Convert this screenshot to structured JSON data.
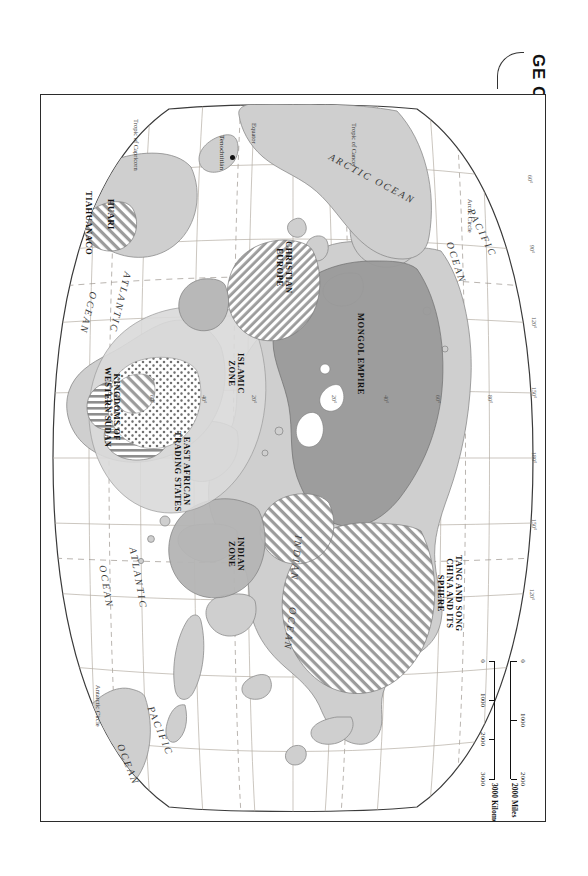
{
  "figure": {
    "title": "GE OF EXPANDING ZONES OF CULTURE, 500–1500",
    "title_note_truncated": true
  },
  "scale": {
    "miles_unit": "2000 Miles",
    "km_unit": "3000 Kilometers",
    "miles_ticks": [
      "0",
      "1000",
      "2000"
    ],
    "km_ticks": [
      "0",
      "1000",
      "2000",
      "3000"
    ]
  },
  "oceans": [
    {
      "name": "ARCTIC OCEAN",
      "id": "arctic-ocean"
    },
    {
      "name": "PACIFIC",
      "id": "pacific-1"
    },
    {
      "name": "OCEAN",
      "id": "pacific-1-ocean"
    },
    {
      "name": "INDIAN",
      "id": "indian-ocean"
    },
    {
      "name": "OCEAN",
      "id": "indian-ocean-word"
    },
    {
      "name": "ATLANTIC",
      "id": "atlantic-n"
    },
    {
      "name": "OCEAN",
      "id": "atlantic-n-ocean"
    },
    {
      "name": "ATLANTIC",
      "id": "atlantic-s"
    },
    {
      "name": "OCEAN",
      "id": "atlantic-s-ocean"
    },
    {
      "name": "PACIFIC",
      "id": "pacific-2"
    },
    {
      "name": "OCEAN",
      "id": "pacific-2-ocean"
    }
  ],
  "zones": [
    {
      "id": "mongol-empire",
      "label": "MONGOL EMPIRE",
      "pattern": "solid-dark-gray"
    },
    {
      "id": "tang-song-china",
      "label": "TANG AND SONG\nCHINA AND ITS\nSPHERE",
      "pattern": "diagonal-hatch"
    },
    {
      "id": "indian-zone",
      "label": "INDIAN\nZONE",
      "pattern": "solid-mid-gray"
    },
    {
      "id": "islamic-zone",
      "label": "ISLAMIC\nZONE",
      "pattern": "solid-light-gray"
    },
    {
      "id": "christian-europe",
      "label": "CHRISTIAN\nEUROPE",
      "pattern": "diagonal-hatch"
    },
    {
      "id": "east-african-trading-states",
      "label": "EAST AFRICAN\nTRADING STATES",
      "pattern": "vertical-hatch"
    },
    {
      "id": "kingdoms-western-sudan",
      "label": "KINGDOMS OF\nWESTERN SUDAN",
      "pattern": "stipple-dots"
    },
    {
      "id": "huari",
      "label": "HUARI",
      "pattern": "diagonal-hatch"
    },
    {
      "id": "tiahuanaco",
      "label": "TIAHUANACO",
      "pattern": "diagonal-hatch"
    }
  ],
  "cities": [
    {
      "id": "tenochtitlan",
      "label": "Tenochtitlán"
    }
  ],
  "latitude_lines": [
    {
      "id": "arctic-circle",
      "label": "Arctic Circle"
    },
    {
      "id": "tropic-of-cancer",
      "label": "Tropic of Cancer"
    },
    {
      "id": "equator",
      "label": "Equator"
    },
    {
      "id": "tropic-of-capricorn",
      "label": "Tropic of Capricorn"
    },
    {
      "id": "antarctic-circle",
      "label": "Antarctic Circle"
    }
  ],
  "graticule_labels": {
    "longitudes": [
      "60°",
      "90°",
      "120°",
      "150°",
      "180°",
      "150°",
      "120°"
    ],
    "latitudes": [
      "80°",
      "60°",
      "40°",
      "20°",
      "20°",
      "40°",
      "60°"
    ]
  },
  "colors": {
    "paper": "#ffffff",
    "frame": "#2b2b2b",
    "land": "#cfcfcf",
    "land_outline": "#8a8a8a",
    "mongol": "#9a9a9a",
    "indian": "#b4b4b4",
    "islamic": "#d7d7d7",
    "hatch": "#8f8f8f",
    "graticule": "#b0a9a0",
    "text": "#111111"
  }
}
